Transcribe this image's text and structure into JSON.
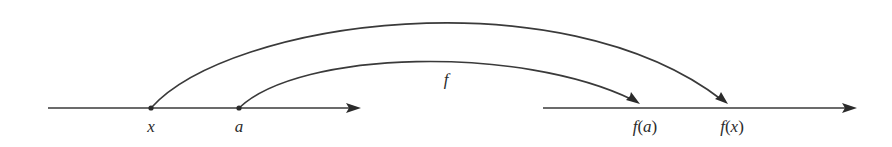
{
  "diagram": {
    "domain_axis": {
      "y": 108,
      "x_start": 48,
      "x_end": 360,
      "points": [
        {
          "label": "x",
          "x": 151
        },
        {
          "label": "a",
          "x": 239
        }
      ]
    },
    "codomain_axis": {
      "y": 108,
      "x_start": 543,
      "x_end": 856,
      "points": [
        {
          "label_f": "f",
          "label_open": "(",
          "label_arg": "a",
          "label_close": ")",
          "x": 645
        },
        {
          "label_f": "f",
          "label_open": "(",
          "label_arg": "x",
          "label_close": ")",
          "x": 730
        }
      ]
    },
    "mapping_label": "f",
    "arrows": [
      {
        "from": "x",
        "to": "f(x)"
      },
      {
        "from": "a",
        "to": "f(a)"
      }
    ],
    "colors": {
      "ink": "#2b2b2b",
      "line": "#3a3a3a",
      "background": "#ffffff"
    }
  }
}
